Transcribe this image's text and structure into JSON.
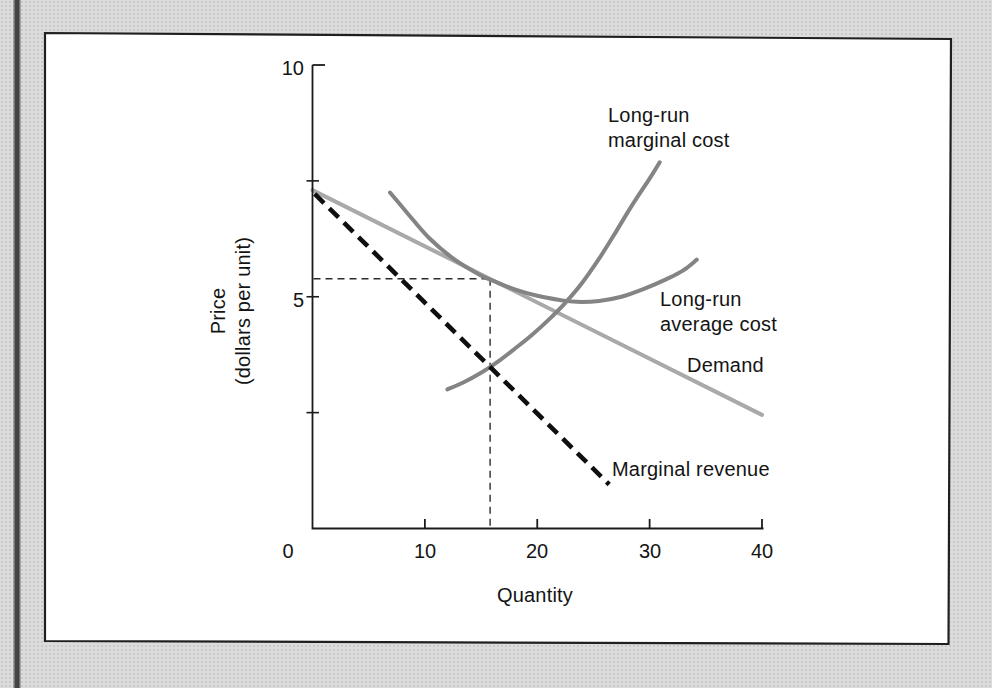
{
  "figure": {
    "kind": "scanned textbook economics figure",
    "colors": {
      "page_background": "#dcdcdc",
      "panel_fill": "#ffffff",
      "panel_border": "#1f1f1f",
      "axis": "#1b1b1b",
      "guide_dash": "#2b2b2b",
      "scan_strip": "#424242"
    }
  },
  "chart": {
    "axis_titles": {
      "x": "Quantity",
      "y_line1": "Price",
      "y_line2": "(dollars per unit)"
    },
    "curve_labels": {
      "lrmc": [
        "Long-run",
        "marginal cost"
      ],
      "lrac": [
        "Long-run",
        "average cost"
      ],
      "demand": "Demand",
      "mr": "Marginal revenue"
    }
  },
  "chart_data": {
    "type": "line",
    "title": "",
    "xlabel": "Quantity",
    "ylabel": "Price (dollars per unit)",
    "xlim": [
      0,
      40
    ],
    "ylim": [
      0,
      10
    ],
    "grid": false,
    "legend": "inline-labels",
    "x_ticks": [
      {
        "v": 0,
        "label": "0",
        "mark": false
      },
      {
        "v": 10,
        "label": "10",
        "mark": true
      },
      {
        "v": 20,
        "label": "20",
        "mark": true
      },
      {
        "v": 30,
        "label": "30",
        "mark": true
      },
      {
        "v": 40,
        "label": "40",
        "mark": true
      }
    ],
    "y_ticks": [
      {
        "v": 10,
        "label": "10",
        "style": "corner"
      },
      {
        "v": 7.5,
        "label": "",
        "style": "minor"
      },
      {
        "v": 5,
        "label": "5",
        "style": "minor"
      },
      {
        "v": 2.5,
        "label": "",
        "style": "minor"
      }
    ],
    "series": [
      {
        "name": "Demand",
        "slug": "demand",
        "color": "#a9a9a9",
        "width": 4,
        "dash": null,
        "points": [
          [
            0,
            7.3
          ],
          [
            40,
            2.45
          ]
        ]
      },
      {
        "name": "Long-run average cost",
        "slug": "long-run-average-cost",
        "color": "#848484",
        "width": 4,
        "dash": null,
        "points": [
          [
            6.9,
            7.25
          ],
          [
            8.6,
            6.76
          ],
          [
            10.4,
            6.26
          ],
          [
            12.6,
            5.81
          ],
          [
            14.9,
            5.47
          ],
          [
            16.5,
            5.3
          ],
          [
            18,
            5.16
          ],
          [
            20,
            5.02
          ],
          [
            22,
            4.93
          ],
          [
            23.5,
            4.89
          ],
          [
            25.5,
            4.91
          ],
          [
            27.5,
            5.0
          ],
          [
            29.5,
            5.17
          ],
          [
            31.5,
            5.38
          ],
          [
            33,
            5.57
          ],
          [
            34.2,
            5.8
          ]
        ]
      },
      {
        "name": "Long-run marginal cost",
        "slug": "long-run-marginal-cost",
        "color": "#848484",
        "width": 4,
        "dash": null,
        "points": [
          [
            12,
            3.0
          ],
          [
            13.5,
            3.16
          ],
          [
            15,
            3.36
          ],
          [
            16.5,
            3.6
          ],
          [
            18,
            3.88
          ],
          [
            19.5,
            4.17
          ],
          [
            21,
            4.5
          ],
          [
            22.5,
            4.87
          ],
          [
            24,
            5.3
          ],
          [
            25.5,
            5.82
          ],
          [
            27,
            6.4
          ],
          [
            28.5,
            7.0
          ],
          [
            30,
            7.55
          ],
          [
            30.9,
            7.9
          ]
        ]
      },
      {
        "name": "Marginal revenue",
        "slug": "marginal-revenue",
        "color": "#0f0f0f",
        "width": 4.6,
        "dash": "13 7.5",
        "points": [
          [
            0.2,
            7.22
          ],
          [
            26.4,
            0.95
          ]
        ]
      }
    ],
    "equilibrium": {
      "quantity": 15.8,
      "price": 5.39
    },
    "annotations": "Dashed guide lines mark the profit-maximizing quantity (~16) and price (~5.4) where demand is tangent to long-run average cost and marginal revenue crosses long-run marginal cost."
  }
}
